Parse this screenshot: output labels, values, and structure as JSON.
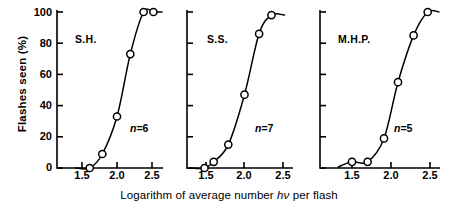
{
  "axes": {
    "ylabel": "Flashes seen (%)",
    "xlabel_prefix": "Logarithm of average number ",
    "xlabel_italic": "hν",
    "xlabel_suffix": " per flash",
    "xlabel_full": "Logarithm of average number hν per flash",
    "yticks": [
      "100",
      "80",
      "60",
      "40",
      "20",
      "0"
    ],
    "xticks": [
      "1.5",
      "2.0",
      "2.5"
    ]
  },
  "panels": [
    {
      "subject": "S.H.",
      "n_label": "n=6",
      "n_symbol": "n",
      "n_value": "=6"
    },
    {
      "subject": "S.S.",
      "n_label": "n=7",
      "n_symbol": "n",
      "n_value": "=7"
    },
    {
      "subject": "M.H.P.",
      "n_label": "n=5",
      "n_symbol": "n",
      "n_value": "=5"
    }
  ],
  "chart_data": {
    "type": "scatter",
    "title": "",
    "xlabel": "Logarithm of average number hν per flash",
    "ylabel": "Flashes seen (%)",
    "xlim": [
      1.25,
      2.62
    ],
    "ylim": [
      0,
      100
    ],
    "xticks": [
      1.5,
      2.0,
      2.5
    ],
    "yticks": [
      0,
      20,
      40,
      60,
      80,
      100
    ],
    "grid": false,
    "legend": "none",
    "panels": [
      {
        "name": "S.H.",
        "annotation": "n=6",
        "n": 6,
        "x": [
          1.61,
          1.79,
          2.0,
          2.19,
          2.38,
          2.52
        ],
        "y": [
          0,
          9,
          33,
          73,
          100,
          100
        ]
      },
      {
        "name": "S.S.",
        "annotation": "n=7",
        "n": 7,
        "x": [
          1.48,
          1.6,
          1.79,
          2.0,
          2.19,
          2.35
        ],
        "y": [
          0,
          4,
          15,
          47,
          86,
          98
        ]
      },
      {
        "name": "M.H.P.",
        "annotation": "n=5",
        "n": 5,
        "x": [
          1.5,
          1.7,
          1.91,
          2.09,
          2.29,
          2.47
        ],
        "y": [
          4,
          4,
          19,
          55,
          85,
          100
        ]
      }
    ]
  }
}
